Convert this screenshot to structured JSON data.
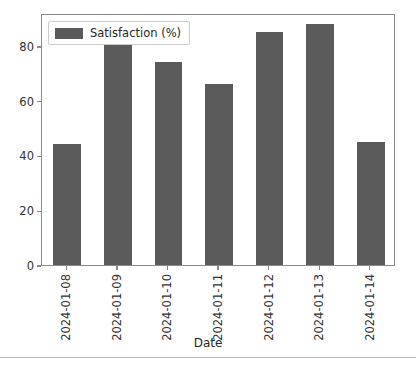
{
  "chart_data": {
    "type": "bar",
    "title": "",
    "xlabel": "Date",
    "ylabel": "",
    "categories": [
      "2024-01-08",
      "2024-01-09",
      "2024-01-10",
      "2024-01-11",
      "2024-01-12",
      "2024-01-13",
      "2024-01-14"
    ],
    "series": [
      {
        "name": "Satisfaction (%)",
        "values": [
          44,
          82,
          74,
          66,
          85,
          88,
          45
        ],
        "color": "#5a5a5a"
      }
    ],
    "ylim": [
      0,
      92
    ],
    "yticks": [
      0,
      20,
      40,
      60,
      80
    ],
    "ytick_labels": [
      "0",
      "20",
      "40",
      "60",
      "80"
    ],
    "grid": false,
    "legend_position": "upper left",
    "legend_entries": [
      "Satisfaction (%)"
    ]
  },
  "axes": {
    "x_title": "Date",
    "y_title": ""
  },
  "legend": {
    "label": "Satisfaction (%)"
  },
  "colors": {
    "bar": "#5a5a5a",
    "axis": "#8a8a8a",
    "text": "#333333",
    "background": "#ffffff",
    "separator": "#b5b5b5"
  }
}
